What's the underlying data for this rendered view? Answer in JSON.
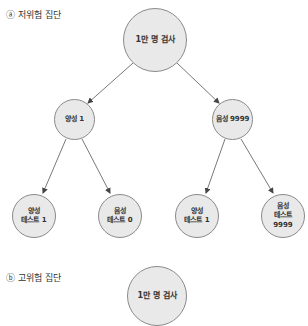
{
  "section_a": {
    "label": "ⓐ 저위험 집단",
    "root": {
      "label": "1만 명 검사"
    },
    "positive": {
      "label": "양성 1"
    },
    "negative": {
      "label": "음성 9999"
    },
    "leaves": [
      {
        "line1": "양성",
        "line2": "테스트 1",
        "line3": ""
      },
      {
        "line1": "음성",
        "line2": "테스트 0",
        "line3": ""
      },
      {
        "line1": "양성",
        "line2": "테스트 1",
        "line3": ""
      },
      {
        "line1": "음성",
        "line2": "테스트",
        "line3": "9999"
      }
    ]
  },
  "section_b": {
    "label": "ⓑ 고위험 집단",
    "root": {
      "label": "1만 명 검사"
    }
  },
  "colors": {
    "node_fill": "#e9e9e9",
    "node_border": "#8a8a8a",
    "edge": "#555555"
  }
}
